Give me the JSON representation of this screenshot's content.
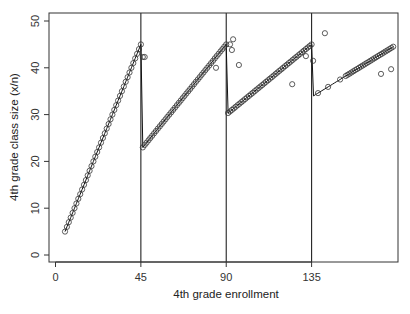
{
  "chart_data": {
    "type": "scatter",
    "title": "",
    "xlabel": "4th grade enrollment",
    "ylabel": "4th grade class size (x/n)",
    "xlim": [
      -3,
      181
    ],
    "ylim": [
      -1.5,
      51.5
    ],
    "x_ticks": [
      0,
      45,
      90,
      135
    ],
    "y_ticks": [
      0,
      10,
      20,
      30,
      40,
      50
    ],
    "x_tick_labels": [
      "0",
      "45",
      "90",
      "135"
    ],
    "y_tick_labels": [
      "0",
      "10",
      "20",
      "30",
      "40",
      "50"
    ],
    "vertical_lines": [
      45,
      90,
      135
    ],
    "grid": false,
    "legend": null,
    "line": {
      "name": "predicted class size (step rule, cap 45)",
      "rule": "x / (floor((x-1)/45) + 1)",
      "x_range": [
        5,
        178
      ]
    },
    "points_on_line_x_range": [
      5,
      178
    ],
    "outliers": [
      {
        "x": 46,
        "y": 42.3
      },
      {
        "x": 47,
        "y": 42.3
      },
      {
        "x": 84.6,
        "y": 40.0
      },
      {
        "x": 92,
        "y": 45.0
      },
      {
        "x": 93,
        "y": 43.8
      },
      {
        "x": 93.6,
        "y": 46.1
      },
      {
        "x": 96.7,
        "y": 40.6
      },
      {
        "x": 124.8,
        "y": 36.5
      },
      {
        "x": 132,
        "y": 42.5
      },
      {
        "x": 135.8,
        "y": 41.5
      },
      {
        "x": 142,
        "y": 47.4
      },
      {
        "x": 171.6,
        "y": 38.7
      },
      {
        "x": 176.9,
        "y": 39.7
      }
    ],
    "sparse_points_segment4": [
      138.4,
      143.7,
      150.0
    ]
  }
}
